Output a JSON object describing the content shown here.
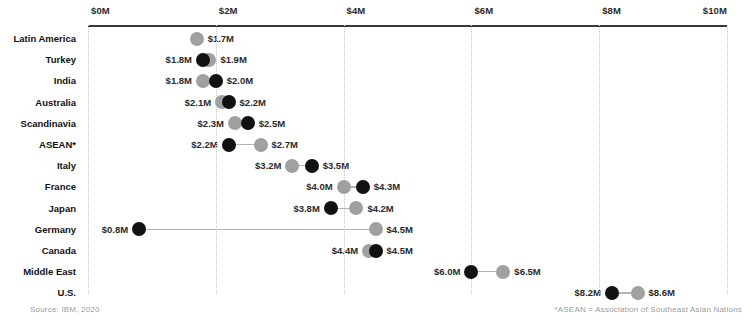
{
  "chart_data": {
    "type": "scatter",
    "title": "",
    "subtitle": "",
    "xlabel": "",
    "ylabel": "",
    "xlim": [
      0,
      10
    ],
    "grid": true,
    "legend": "none",
    "axis_tick_labels": [
      "$0M",
      "$2M",
      "$4M",
      "$6M",
      "$8M",
      "$10M"
    ],
    "axis_tick_values": [
      0,
      2,
      4,
      6,
      8,
      10
    ],
    "series": [
      {
        "name": "dark",
        "color": "#111111"
      },
      {
        "name": "light",
        "color": "#a0a0a0"
      }
    ],
    "categories": [
      "Latin America",
      "Turkey",
      "India",
      "Australia",
      "Scandinavia",
      "ASEAN*",
      "Italy",
      "France",
      "Japan",
      "Germany",
      "Canada",
      "Middle East",
      "U.S."
    ],
    "rows": [
      {
        "label": "Latin America",
        "points": [
          {
            "series": "light",
            "value": 1.7,
            "text": "$1.7M",
            "side": "right"
          }
        ]
      },
      {
        "label": "Turkey",
        "points": [
          {
            "series": "dark",
            "value": 1.8,
            "text": "$1.8M",
            "side": "left"
          },
          {
            "series": "light",
            "value": 1.9,
            "text": "$1.9M",
            "side": "right"
          }
        ]
      },
      {
        "label": "India",
        "points": [
          {
            "series": "light",
            "value": 1.8,
            "text": "$1.8M",
            "side": "left"
          },
          {
            "series": "dark",
            "value": 2.0,
            "text": "$2.0M",
            "side": "right"
          }
        ]
      },
      {
        "label": "Australia",
        "points": [
          {
            "series": "light",
            "value": 2.1,
            "text": "$2.1M",
            "side": "left"
          },
          {
            "series": "dark",
            "value": 2.2,
            "text": "$2.2M",
            "side": "right"
          }
        ]
      },
      {
        "label": "Scandinavia",
        "points": [
          {
            "series": "light",
            "value": 2.3,
            "text": "$2.3M",
            "side": "left"
          },
          {
            "series": "dark",
            "value": 2.5,
            "text": "$2.5M",
            "side": "right"
          }
        ]
      },
      {
        "label": "ASEAN*",
        "points": [
          {
            "series": "dark",
            "value": 2.2,
            "text": "$2.2M",
            "side": "left"
          },
          {
            "series": "light",
            "value": 2.7,
            "text": "$2.7M",
            "side": "right"
          }
        ]
      },
      {
        "label": "Italy",
        "points": [
          {
            "series": "light",
            "value": 3.2,
            "text": "$3.2M",
            "side": "left"
          },
          {
            "series": "dark",
            "value": 3.5,
            "text": "$3.5M",
            "side": "right"
          }
        ]
      },
      {
        "label": "France",
        "points": [
          {
            "series": "light",
            "value": 4.0,
            "text": "$4.0M",
            "side": "left"
          },
          {
            "series": "dark",
            "value": 4.3,
            "text": "$4.3M",
            "side": "right"
          }
        ]
      },
      {
        "label": "Japan",
        "points": [
          {
            "series": "dark",
            "value": 3.8,
            "text": "$3.8M",
            "side": "left"
          },
          {
            "series": "light",
            "value": 4.2,
            "text": "$4.2M",
            "side": "right"
          }
        ]
      },
      {
        "label": "Germany",
        "points": [
          {
            "series": "dark",
            "value": 0.8,
            "text": "$0.8M",
            "side": "left"
          },
          {
            "series": "light",
            "value": 4.5,
            "text": "$4.5M",
            "side": "right"
          }
        ]
      },
      {
        "label": "Canada",
        "points": [
          {
            "series": "light",
            "value": 4.4,
            "text": "$4.4M",
            "side": "left"
          },
          {
            "series": "dark",
            "value": 4.5,
            "text": "$4.5M",
            "side": "right"
          }
        ]
      },
      {
        "label": "Middle East",
        "points": [
          {
            "series": "dark",
            "value": 6.0,
            "text": "$6.0M",
            "side": "left"
          },
          {
            "series": "light",
            "value": 6.5,
            "text": "$6.5M",
            "side": "right"
          }
        ]
      },
      {
        "label": "U.S.",
        "points": [
          {
            "series": "dark",
            "value": 8.2,
            "text": "$8.2M",
            "side": "left"
          },
          {
            "series": "light",
            "value": 8.6,
            "text": "$8.6M",
            "side": "right"
          }
        ]
      }
    ]
  },
  "footer": {
    "source": "Source: IBM, 2020",
    "footnote": "*ASEAN = Association of Southeast Asian Nations"
  }
}
